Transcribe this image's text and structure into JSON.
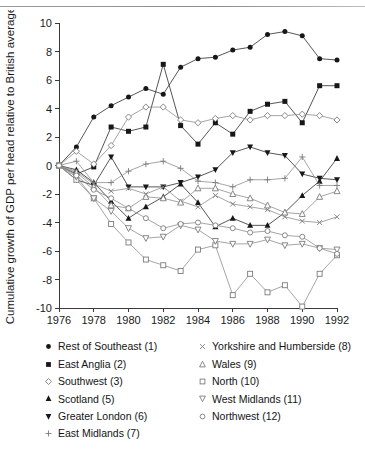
{
  "chart_data": {
    "type": "line",
    "title": "",
    "xlabel": "",
    "ylabel": "Cumulative growth of GDP per head relative to British average",
    "xlim": [
      1976,
      1992
    ],
    "ylim": [
      -10,
      10
    ],
    "grid": false,
    "legend_position": "below-axes-two-columns",
    "x": [
      1976,
      1977,
      1978,
      1979,
      1980,
      1981,
      1982,
      1983,
      1984,
      1985,
      1986,
      1987,
      1988,
      1989,
      1990,
      1991,
      1992
    ],
    "xticks": [
      1976,
      1978,
      1980,
      1982,
      1984,
      1986,
      1988,
      1990,
      1992
    ],
    "yticks": [
      -10,
      -8,
      -6,
      -4,
      -2,
      0,
      2,
      4,
      6,
      8,
      10
    ],
    "series": [
      {
        "name": "Rest of Southeast (1)",
        "number": 1,
        "marker": "filled-circle",
        "values": [
          0.0,
          1.3,
          3.4,
          4.2,
          4.8,
          5.4,
          5.0,
          6.9,
          7.5,
          7.6,
          8.1,
          8.3,
          9.2,
          9.4,
          9.1,
          7.5,
          7.4
        ]
      },
      {
        "name": "East Anglia (2)",
        "number": 2,
        "marker": "filled-square",
        "values": [
          0.0,
          -0.6,
          -0.1,
          2.7,
          2.4,
          2.7,
          7.1,
          2.8,
          1.5,
          3.0,
          2.2,
          3.8,
          4.3,
          4.5,
          3.0,
          5.6,
          5.6
        ]
      },
      {
        "name": "Southwest (3)",
        "number": 3,
        "marker": "open-diamond",
        "values": [
          0.0,
          1.0,
          0.1,
          1.4,
          3.4,
          4.1,
          4.1,
          3.2,
          3.0,
          3.3,
          3.5,
          3.2,
          3.5,
          3.5,
          3.6,
          3.5,
          3.2
        ]
      },
      {
        "name": "Scotland (5)",
        "number": 5,
        "marker": "filled-triangle-up",
        "values": [
          0.0,
          -0.3,
          -1.2,
          -2.5,
          -3.7,
          -2.9,
          -2.2,
          -1.3,
          -2.6,
          -4.3,
          -3.7,
          -4.2,
          -4.2,
          -3.3,
          -2.1,
          -1.1,
          0.5
        ]
      },
      {
        "name": "Greater London (6)",
        "number": 6,
        "marker": "filled-triangle-down",
        "values": [
          0.0,
          -1.0,
          -1.4,
          0.6,
          -1.5,
          -1.5,
          -1.5,
          -1.2,
          -0.8,
          -0.3,
          0.9,
          1.3,
          0.9,
          0.7,
          -0.6,
          -0.9,
          -1.0
        ]
      },
      {
        "name": "East Midlands (7)",
        "number": 7,
        "marker": "plus",
        "values": [
          0.0,
          0.3,
          -1.2,
          -1.2,
          -0.4,
          0.1,
          0.3,
          -0.2,
          -1.1,
          -1.2,
          -1.5,
          -1.0,
          -1.0,
          -0.9,
          0.6,
          -1.4,
          -1.4
        ]
      },
      {
        "name": "Yorkshire and Humberside (8)",
        "number": 8,
        "marker": "cross",
        "values": [
          0.0,
          -0.4,
          -1.3,
          -1.8,
          -1.6,
          -2.0,
          -1.5,
          -2.5,
          -2.9,
          -2.1,
          -2.7,
          -2.9,
          -3.1,
          -3.6,
          -3.9,
          -4.0,
          -3.6
        ]
      },
      {
        "name": "Wales (9)",
        "number": 9,
        "marker": "open-triangle-up",
        "values": [
          0.0,
          -0.5,
          -1.5,
          -2.8,
          -3.0,
          -2.2,
          -2.3,
          -2.6,
          -1.6,
          -1.6,
          -2.0,
          -2.3,
          -2.8,
          -3.3,
          -3.4,
          -2.2,
          -1.8
        ]
      },
      {
        "name": "North (10)",
        "number": 10,
        "marker": "open-square",
        "values": [
          0.0,
          -1.0,
          -2.3,
          -4.1,
          -5.4,
          -6.6,
          -7.0,
          -7.4,
          -5.9,
          -5.6,
          -9.1,
          -7.6,
          -8.9,
          -8.4,
          -9.9,
          -7.6,
          -6.3
        ]
      },
      {
        "name": "West Midlands (11)",
        "number": 11,
        "marker": "open-triangle-down",
        "values": [
          0.0,
          -0.8,
          -2.3,
          -3.2,
          -4.4,
          -5.1,
          -5.0,
          -4.2,
          -4.5,
          -5.3,
          -5.5,
          -5.5,
          -5.2,
          -5.6,
          -5.5,
          -5.8,
          -5.9
        ]
      },
      {
        "name": "Northwest (12)",
        "number": 12,
        "marker": "open-circle",
        "values": [
          0.0,
          -0.7,
          -1.7,
          -2.3,
          -3.0,
          -3.7,
          -4.4,
          -4.1,
          -4.0,
          -4.2,
          -4.4,
          -4.7,
          -4.6,
          -4.9,
          -5.0,
          -5.8,
          -6.2
        ]
      }
    ]
  },
  "legend": {
    "left_column": [
      {
        "label": "Rest of Southeast (1)",
        "marker": "filled-circle"
      },
      {
        "label": "East Anglia (2)",
        "marker": "filled-square"
      },
      {
        "label": "Southwest (3)",
        "marker": "open-diamond"
      },
      {
        "label": "Scotland (5)",
        "marker": "filled-triangle-up"
      },
      {
        "label": "Greater London (6)",
        "marker": "filled-triangle-down"
      },
      {
        "label": "East Midlands (7)",
        "marker": "plus"
      }
    ],
    "right_column": [
      {
        "label": "Yorkshire and Humberside (8)",
        "marker": "cross"
      },
      {
        "label": "Wales (9)",
        "marker": "open-triangle-up"
      },
      {
        "label": "North (10)",
        "marker": "open-square"
      },
      {
        "label": "West Midlands (11)",
        "marker": "open-triangle-down"
      },
      {
        "label": "Northwest (12)",
        "marker": "open-circle"
      }
    ]
  },
  "colors": {
    "axis": "#3a3a3a",
    "line_dark": "#2b2b2b",
    "line_light": "#8e8e8e",
    "marker_fill": "#171717",
    "marker_open_stroke": "#7c7c7c",
    "text": "#1a1a1a",
    "background": "#ffffff"
  }
}
